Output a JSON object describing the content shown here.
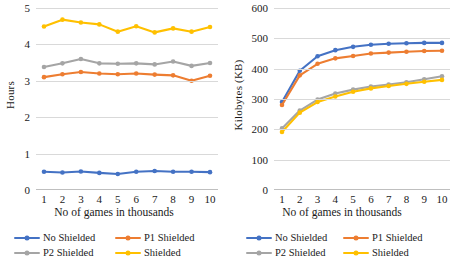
{
  "colors": {
    "no_shielded": "#4472C4",
    "p1_shielded": "#ED7D31",
    "p2_shielded": "#A5A5A5",
    "shielded": "#FFC000",
    "grid": "#D9D9D9"
  },
  "legend": {
    "no_shielded": "No Shielded",
    "p1_shielded": "P1 Shielded",
    "p2_shielded": "P2 Shielded",
    "shielded": "Shielded"
  },
  "chart_data": [
    {
      "type": "line",
      "title": "",
      "xlabel": "No of games in thousands",
      "ylabel": "Hours",
      "categories": [
        1,
        2,
        3,
        4,
        5,
        6,
        7,
        8,
        9,
        10
      ],
      "xticklabels": [
        "1",
        "2",
        "3",
        "4",
        "5",
        "6",
        "7",
        "8",
        "9",
        "10"
      ],
      "yticklabels": [
        "0",
        "1",
        "2",
        "3",
        "4",
        "5"
      ],
      "ylim": [
        0,
        5
      ],
      "ytickvalues": [
        0,
        1,
        2,
        3,
        4,
        5
      ],
      "grid": true,
      "legend_position": "bottom",
      "series": [
        {
          "name": "No Shielded",
          "color": "#4472C4",
          "values": [
            0.5,
            0.48,
            0.51,
            0.47,
            0.44,
            0.5,
            0.52,
            0.5,
            0.5,
            0.49
          ]
        },
        {
          "name": "P1 Shielded",
          "color": "#ED7D31",
          "values": [
            3.1,
            3.18,
            3.24,
            3.2,
            3.18,
            3.2,
            3.17,
            3.15,
            3.0,
            3.14
          ]
        },
        {
          "name": "P2 Shielded",
          "color": "#A5A5A5",
          "values": [
            3.38,
            3.48,
            3.6,
            3.48,
            3.47,
            3.48,
            3.45,
            3.53,
            3.41,
            3.49
          ]
        },
        {
          "name": "Shielded",
          "color": "#FFC000",
          "values": [
            4.49,
            4.68,
            4.6,
            4.55,
            4.35,
            4.5,
            4.33,
            4.44,
            4.35,
            4.48
          ]
        }
      ]
    },
    {
      "type": "line",
      "title": "",
      "xlabel": "No of games in thousands",
      "ylabel": "Kilobytes (KB)",
      "categories": [
        1,
        2,
        3,
        4,
        5,
        6,
        7,
        8,
        9,
        10
      ],
      "xticklabels": [
        "1",
        "2",
        "3",
        "4",
        "5",
        "6",
        "7",
        "8",
        "9",
        "10"
      ],
      "yticklabels": [
        "0",
        "100",
        "200",
        "300",
        "400",
        "500",
        "600"
      ],
      "ylim": [
        0,
        600
      ],
      "ytickvalues": [
        0,
        100,
        200,
        300,
        400,
        500,
        600
      ],
      "grid": true,
      "legend_position": "bottom",
      "series": [
        {
          "name": "No Shielded",
          "color": "#4472C4",
          "values": [
            290,
            393,
            441,
            461,
            472,
            479,
            482,
            484,
            485,
            485
          ]
        },
        {
          "name": "P1 Shielded",
          "color": "#ED7D31",
          "values": [
            280,
            378,
            416,
            434,
            442,
            450,
            453,
            456,
            458,
            459
          ]
        },
        {
          "name": "P2 Shielded",
          "color": "#A5A5A5",
          "values": [
            203,
            262,
            298,
            318,
            331,
            341,
            348,
            355,
            365,
            375
          ]
        },
        {
          "name": "Shielded",
          "color": "#FFC000",
          "values": [
            191,
            255,
            290,
            308,
            324,
            335,
            343,
            350,
            357,
            363
          ]
        }
      ]
    }
  ]
}
